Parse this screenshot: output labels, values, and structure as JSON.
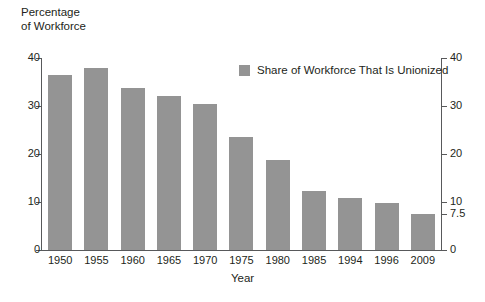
{
  "chart_data": {
    "type": "bar",
    "title": "",
    "ylabel": "Percentage\nof Workforce",
    "xlabel": "Year",
    "categories": [
      "1950",
      "1955",
      "1960",
      "1965",
      "1970",
      "1975",
      "1980",
      "1985",
      "1994",
      "1996",
      "2009"
    ],
    "values": [
      36.5,
      38.0,
      33.8,
      32.0,
      30.5,
      23.5,
      18.7,
      12.2,
      10.8,
      9.8,
      7.5
    ],
    "series": [
      {
        "name": "Share of Workforce That Is Unionized",
        "values": [
          36.5,
          38.0,
          33.8,
          32.0,
          30.5,
          23.5,
          18.7,
          12.2,
          10.8,
          9.8,
          7.5
        ]
      }
    ],
    "ylim": [
      0,
      40
    ],
    "yticks_left": [
      "40",
      "30",
      "20",
      "10",
      "0"
    ],
    "yticks_left_values": [
      40,
      30,
      20,
      10,
      0
    ],
    "yticks_right": [
      "40",
      "30",
      "20",
      "10",
      "7.5",
      "0"
    ],
    "yticks_right_values": [
      40,
      30,
      20,
      10,
      7.5,
      0
    ],
    "grid": false,
    "legend": {
      "position": "top-right-inside",
      "entries": [
        {
          "label": "Share of Workforce That Is Unionized",
          "color": "#949494"
        }
      ]
    },
    "colors": {
      "bar": "#949494",
      "axis": "#58595b",
      "text": "#231f20",
      "background": "#ffffff"
    }
  }
}
